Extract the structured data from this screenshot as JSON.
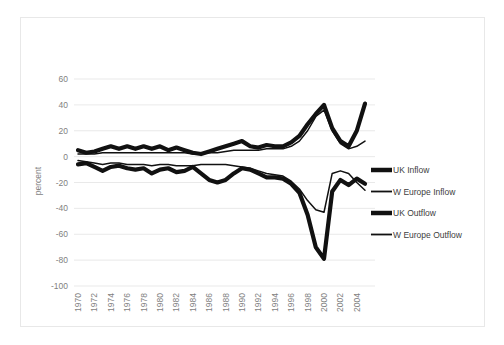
{
  "chart_data": {
    "type": "line",
    "title": "",
    "subtitle": "",
    "xlabel": "",
    "ylabel": "percent",
    "grid": true,
    "legend_position": "right",
    "ylim": [
      -100,
      60
    ],
    "yticks": [
      60,
      40,
      20,
      0,
      -20,
      -40,
      -60,
      -80,
      -100
    ],
    "ytick_labels": [
      "60",
      "40",
      "20",
      "0",
      "-20",
      "-40",
      "-60",
      "-80",
      "-100"
    ],
    "x": [
      1970,
      1971,
      1972,
      1973,
      1974,
      1975,
      1976,
      1977,
      1978,
      1979,
      1980,
      1981,
      1982,
      1983,
      1984,
      1985,
      1986,
      1987,
      1988,
      1989,
      1990,
      1991,
      1992,
      1993,
      1994,
      1995,
      1996,
      1997,
      1998,
      1999,
      2000,
      2001,
      2002,
      2003,
      2004,
      2005
    ],
    "xtick_labels": [
      "1970",
      "1972",
      "1974",
      "1976",
      "1978",
      "1980",
      "1982",
      "1984",
      "1986",
      "1988",
      "1990",
      "1992",
      "1994",
      "1996",
      "1998",
      "2000",
      "2002",
      "2004"
    ],
    "xlim": [
      1970,
      2005
    ],
    "series": [
      {
        "name": "UK Inflow",
        "style": "thick",
        "values": [
          5,
          3,
          4,
          6,
          8,
          6,
          8,
          6,
          8,
          6,
          8,
          5,
          7,
          5,
          3,
          2,
          4,
          6,
          8,
          10,
          12,
          8,
          7,
          9,
          8,
          8,
          11,
          16,
          25,
          33,
          40,
          22,
          12,
          8,
          20,
          41
        ]
      },
      {
        "name": "W Europe Inflow",
        "style": "thin",
        "values": [
          2,
          2,
          2,
          3,
          3,
          3,
          3,
          3,
          3,
          3,
          3,
          3,
          3,
          3,
          2,
          2,
          3,
          3,
          4,
          5,
          5,
          5,
          5,
          6,
          6,
          6,
          8,
          12,
          20,
          31,
          36,
          20,
          10,
          6,
          8,
          12
        ]
      },
      {
        "name": "UK Outflow",
        "style": "thick",
        "values": [
          -6,
          -5,
          -8,
          -11,
          -8,
          -7,
          -9,
          -10,
          -9,
          -13,
          -10,
          -9,
          -12,
          -11,
          -8,
          -13,
          -18,
          -20,
          -18,
          -13,
          -9,
          -10,
          -13,
          -16,
          -16,
          -17,
          -21,
          -28,
          -45,
          -70,
          -79,
          -27,
          -18,
          -22,
          -17,
          -21
        ]
      },
      {
        "name": "W Europe Outflow",
        "style": "thin",
        "values": [
          -3,
          -4,
          -5,
          -6,
          -5,
          -5,
          -6,
          -6,
          -6,
          -7,
          -6,
          -6,
          -7,
          -7,
          -7,
          -6,
          -6,
          -6,
          -6,
          -7,
          -8,
          -9,
          -11,
          -13,
          -14,
          -15,
          -19,
          -25,
          -34,
          -41,
          -43,
          -13,
          -11,
          -13,
          -20,
          -26
        ]
      }
    ]
  },
  "legend": {
    "items": [
      {
        "label": "UK Inflow",
        "style": "thick"
      },
      {
        "label": "W Europe Inflow",
        "style": "thin"
      },
      {
        "label": "UK Outflow",
        "style": "thick"
      },
      {
        "label": "W Europe Outflow",
        "style": "thin"
      }
    ]
  },
  "axes": {
    "y_title": "percent"
  }
}
